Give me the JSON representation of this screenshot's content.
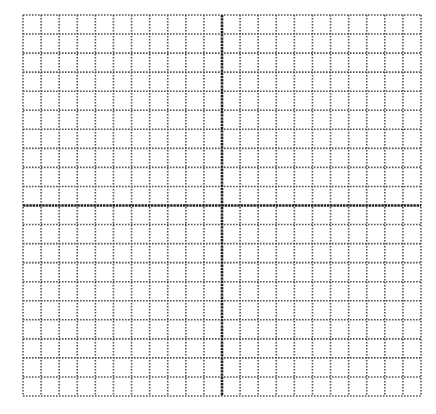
{
  "diagram": {
    "type": "coordinate-grid",
    "grid": {
      "left": 23,
      "top": 15,
      "right": 421,
      "bottom": 396,
      "columns": 22,
      "rows": 20,
      "grid_line_color": "#555555",
      "axis_color": "#222222",
      "background": "#ffffff"
    },
    "axes": {
      "x_axis_row_index": 10,
      "y_axis_column_index": 11,
      "x_axis_label": "",
      "y_axis_label": ""
    }
  }
}
